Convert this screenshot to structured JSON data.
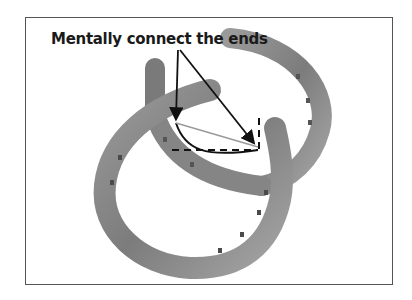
{
  "figure": {
    "label": "Mentally connect the ends",
    "colors": {
      "border": "#555555",
      "horseshoe": "#8a8a8a",
      "annotation": "#111111",
      "chord": "#9a9a9a"
    }
  }
}
